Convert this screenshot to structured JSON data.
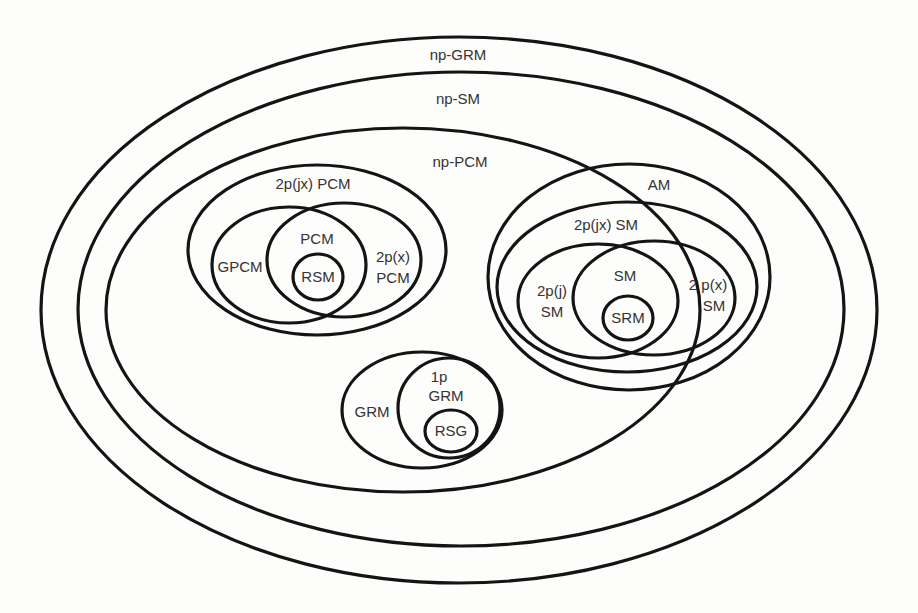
{
  "diagram": {
    "colors": {
      "stroke": "#141414",
      "text": "#333333",
      "background": "#fdfdfc"
    },
    "sets": [
      {
        "id": "np-grm",
        "label": "np-GRM",
        "cx": 459,
        "cy": 310,
        "rx": 418,
        "ry": 273,
        "label_lines": [
          "np-GRM"
        ],
        "label_x": 458,
        "label_y": 56
      },
      {
        "id": "np-sm",
        "label": "np-SM",
        "cx": 461,
        "cy": 309,
        "rx": 383,
        "ry": 237,
        "label_lines": [
          "np-SM"
        ],
        "label_x": 458,
        "label_y": 100
      },
      {
        "id": "np-pcm",
        "label": "np-PCM",
        "cx": 403,
        "cy": 310,
        "rx": 297,
        "ry": 182,
        "label_lines": [
          "np-PCM"
        ],
        "label_x": 460,
        "label_y": 163
      },
      {
        "id": "2pjx-pcm",
        "label": "2p(jx) PCM",
        "cx": 317,
        "cy": 250,
        "rx": 129,
        "ry": 85,
        "label_lines": [
          "2p(jx) PCM"
        ],
        "label_x": 313,
        "label_y": 185
      },
      {
        "id": "gpcm",
        "label": "GPCM",
        "cx": 289,
        "cy": 265,
        "rx": 77,
        "ry": 58,
        "label_lines": [
          "GPCM"
        ],
        "label_x": 240,
        "label_y": 268
      },
      {
        "id": "2px-pcm",
        "label": "2p(x) PCM",
        "cx": 344,
        "cy": 260,
        "rx": 77,
        "ry": 57,
        "label_lines": [
          "2p(x)",
          "PCM"
        ],
        "label_x": 393,
        "label_y": 268
      },
      {
        "id": "pcm",
        "label": "PCM",
        "region": "intersection of GPCM and 2p(x) PCM",
        "label_lines": [
          "PCM"
        ],
        "label_x": 317,
        "label_y": 240
      },
      {
        "id": "rsm",
        "label": "RSM",
        "cx": 318,
        "cy": 277,
        "rx": 25,
        "ry": 23,
        "label_lines": [
          "RSM"
        ],
        "label_x": 318,
        "label_y": 278
      },
      {
        "id": "am",
        "label": "AM",
        "cx": 629,
        "cy": 277,
        "rx": 141,
        "ry": 113,
        "label_lines": [
          "AM"
        ],
        "label_x": 659,
        "label_y": 186
      },
      {
        "id": "2pjx-sm",
        "label": "2p(jx) SM",
        "cx": 627,
        "cy": 287,
        "rx": 130,
        "ry": 85,
        "label_lines": [
          "2p(jx) SM"
        ],
        "label_x": 606,
        "label_y": 226
      },
      {
        "id": "2pj-sm",
        "label": "2p(j) SM",
        "cx": 598,
        "cy": 301,
        "rx": 80,
        "ry": 57,
        "label_lines": [
          "2p(j)",
          "SM"
        ],
        "label_x": 552,
        "label_y": 292
      },
      {
        "id": "2px-sm",
        "label": "2 p(x) SM",
        "cx": 654,
        "cy": 298,
        "rx": 81,
        "ry": 57,
        "label_lines": [
          "2 p(x)",
          "SM"
        ],
        "label_x": 712,
        "label_y": 286
      },
      {
        "id": "sm",
        "label": "SM",
        "region": "intersection of 2p(j) SM and 2p(x) SM",
        "label_lines": [
          "SM"
        ],
        "label_x": 625,
        "label_y": 277
      },
      {
        "id": "srm",
        "label": "SRM",
        "cx": 628,
        "cy": 318,
        "rx": 25,
        "ry": 22,
        "label_lines": [
          "SRM"
        ],
        "label_x": 628,
        "label_y": 319
      },
      {
        "id": "grm",
        "label": "GRM",
        "cx": 422,
        "cy": 410,
        "rx": 80,
        "ry": 58,
        "label_lines": [
          "GRM"
        ],
        "label_x": 372,
        "label_y": 413
      },
      {
        "id": "1p-grm",
        "label": "1p GRM",
        "cx": 449,
        "cy": 408,
        "rx": 51,
        "ry": 50,
        "label_lines": [
          "1p",
          "GRM"
        ],
        "label_x": 445,
        "label_y": 380
      },
      {
        "id": "rsg",
        "label": "RSG",
        "cx": 451,
        "cy": 431,
        "rx": 26,
        "ry": 21,
        "label_lines": [
          "RSG"
        ],
        "label_x": 451,
        "label_y": 432
      }
    ],
    "labels": {
      "np_grm": "np-GRM",
      "np_sm": "np-SM",
      "np_pcm": "np-PCM",
      "pcm_2pjx": "2p(jx) PCM",
      "gpcm": "GPCM",
      "pcm": "PCM",
      "pcm_2px_line1": "2p(x)",
      "pcm_2px_line2": "PCM",
      "rsm": "RSM",
      "am": "AM",
      "sm_2pjx": "2p(jx) SM",
      "sm": "SM",
      "sm_2pj_line1": "2p(j)",
      "sm_2pj_line2": "SM",
      "sm_2px_line1": "2 p(x)",
      "sm_2px_line2": "SM",
      "srm": "SRM",
      "grm": "GRM",
      "grm_1p_line1": "1p",
      "grm_1p_line2": "GRM",
      "rsg": "RSG"
    }
  }
}
